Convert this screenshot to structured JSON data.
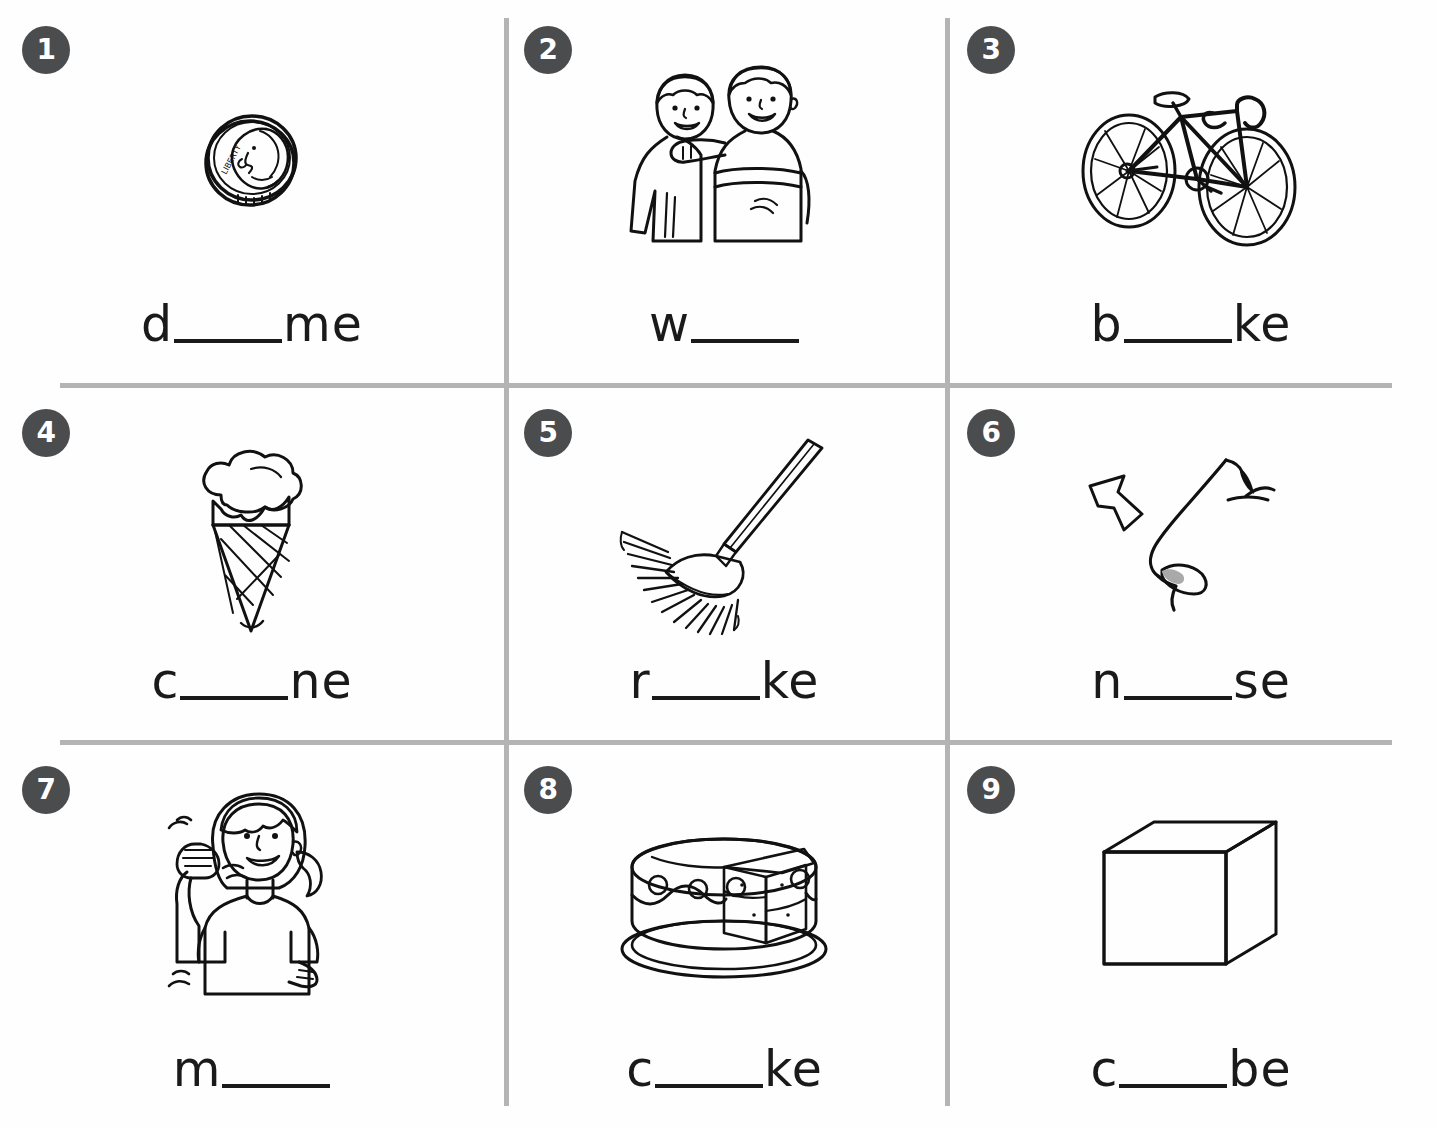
{
  "worksheet": {
    "title": "Long Vowel Picture Word Fill-In",
    "background_color": "#ffffff",
    "rule_color": "#b4b4b4",
    "badge_color": "#4b4c4e",
    "badge_text_color": "#ffffff",
    "text_color": "#1a1a1a",
    "shade_color": "#a9a9a9",
    "rows": 3,
    "columns": 3
  },
  "items": [
    {
      "number": "1",
      "picture": "dime-coin",
      "picture_caption": "dime coin with Liberty profile",
      "prefix": "d",
      "suffix": "me",
      "answer": "dime"
    },
    {
      "number": "2",
      "picture": "two-boys-waving",
      "picture_caption": "two boys with arms around shoulders",
      "prefix": "w",
      "suffix": "",
      "answer": "wave"
    },
    {
      "number": "3",
      "picture": "bicycle",
      "picture_caption": "bicycle with drop handlebars",
      "prefix": "b",
      "suffix": "ke",
      "answer": "bike"
    },
    {
      "number": "4",
      "picture": "ice-cream-cone",
      "picture_caption": "ice cream scoop on a waffle cone",
      "prefix": "c",
      "suffix": "ne",
      "answer": "cone"
    },
    {
      "number": "5",
      "picture": "leaf-rake",
      "picture_caption": "fan leaf rake with long handle",
      "prefix": "r",
      "suffix": "ke",
      "answer": "rake"
    },
    {
      "number": "6",
      "picture": "nose-profile-arrow",
      "picture_caption": "side profile of a nose with arrow pointing to it",
      "prefix": "n",
      "suffix": "se",
      "answer": "nose"
    },
    {
      "number": "7",
      "picture": "girl-pointing-at-self",
      "picture_caption": "girl in gray shirt pointing thumb at herself",
      "prefix": "m",
      "suffix": "",
      "answer": "me"
    },
    {
      "number": "8",
      "picture": "cake-with-slice",
      "picture_caption": "frosted cake on plate with a slice cut",
      "prefix": "c",
      "suffix": "ke",
      "answer": "cake"
    },
    {
      "number": "9",
      "picture": "cube",
      "picture_caption": "three dimensional cube with shaded front face",
      "prefix": "c",
      "suffix": "be",
      "answer": "cube"
    }
  ]
}
